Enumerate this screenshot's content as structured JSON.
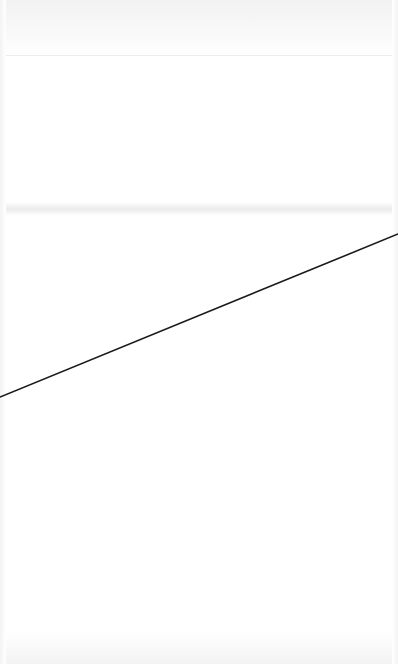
{
  "canvas": {
    "width": 398,
    "height": 664,
    "background": "#ffffff"
  },
  "line": {
    "x1": 0,
    "y1": 397,
    "x2": 398,
    "y2": 234,
    "color": "#1a1a1a",
    "width": 1.6
  }
}
